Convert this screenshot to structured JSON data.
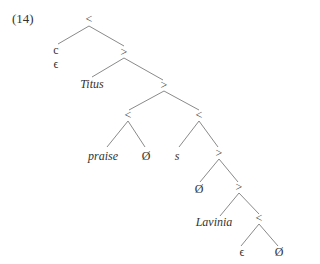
{
  "example_number": "(14)",
  "nodes": {
    "root": "<",
    "c": "c",
    "c_eps": "ϵ",
    "n2": ">",
    "titus": "Titus",
    "n3": ">",
    "n4a": "<",
    "praise": "praise",
    "null1": "Ø",
    "n4b": "<",
    "s": "s",
    "n5": ">",
    "null2": "Ø",
    "n6": ">",
    "lavinia": "Lavinia",
    "n7": "<",
    "eps2": "ϵ",
    "null3": "Ø"
  },
  "colors": {
    "line": "#8a8a8a",
    "text": "#333333"
  }
}
